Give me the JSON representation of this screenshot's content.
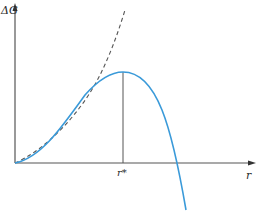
{
  "diagram": {
    "title": "",
    "y_axis_label": "ΔG",
    "x_axis_label": "r",
    "critical_radius_label": "r*",
    "colors": {
      "axis": "#555555",
      "solid_curve": "#3a9ad9",
      "dashed_curve": "#555555",
      "guide_line": "#555555",
      "background": "#ffffff"
    },
    "curves": [
      {
        "name": "total-free-energy",
        "style": "solid",
        "color": "#3a9ad9",
        "shape": "rises from origin to maximum at r*, then falls below zero"
      },
      {
        "name": "surface-energy-term",
        "style": "dashed",
        "color": "#555555",
        "shape": "monotonically increasing from origin"
      }
    ],
    "annotations": [
      {
        "type": "vertical-line",
        "from": "maximum of solid curve",
        "to": "r axis",
        "label": "r*"
      }
    ]
  }
}
